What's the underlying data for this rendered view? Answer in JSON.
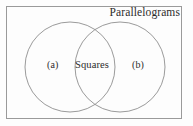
{
  "figure": {
    "type": "venn-diagram",
    "universe_label": "Parallelograms",
    "intersection_label": "Squares",
    "left_region_label": "(a)",
    "right_region_label": "(b)",
    "colors": {
      "background": "#fdfdfd",
      "frame_stroke": "#9a9a9a",
      "circle_stroke": "#8f8f8f",
      "text": "#2c2c2c"
    },
    "geometry": {
      "canvas": {
        "width": 193,
        "height": 126
      },
      "frame": {
        "x": 6.5,
        "y": 6.5,
        "width": 175,
        "height": 112
      },
      "left_circle": {
        "cx": 70,
        "cy": 67,
        "r": 45
      },
      "right_circle": {
        "cx": 120,
        "cy": 67,
        "r": 45
      }
    }
  }
}
